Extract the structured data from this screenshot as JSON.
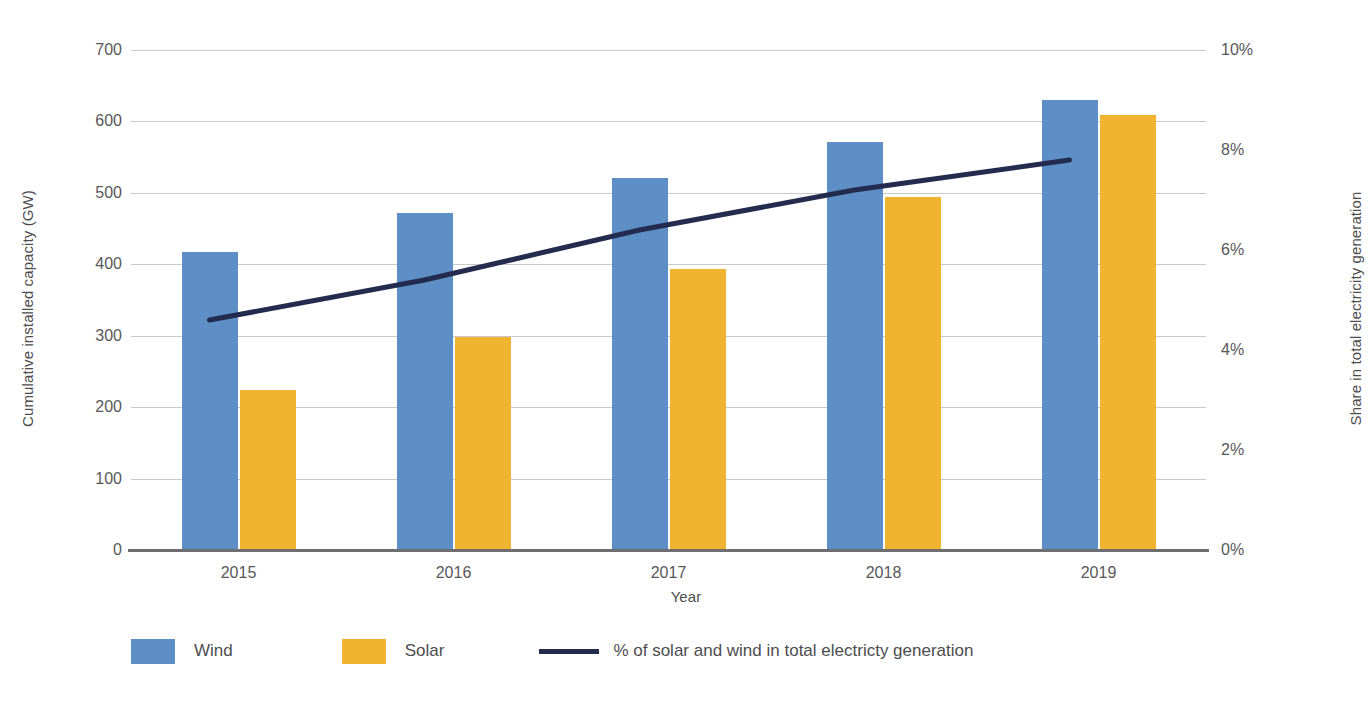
{
  "chart_data": {
    "type": "bar",
    "title": "",
    "subtitle": "",
    "xlabel": "Year",
    "ylabel": "Cumulative installed capacity (GW)",
    "y2label": "Share in total electricity generation",
    "categories": [
      "2015",
      "2016",
      "2017",
      "2018",
      "2019"
    ],
    "series": [
      {
        "name": "Wind",
        "type": "bar",
        "axis": "left",
        "color": "#5d8fc6",
        "unit": "GW",
        "values": [
          416,
          470,
          520,
          570,
          628
        ]
      },
      {
        "name": "Solar",
        "type": "bar",
        "axis": "left",
        "color": "#f0b431",
        "unit": "GW",
        "values": [
          222,
          297,
          392,
          493,
          607
        ]
      },
      {
        "name": "% of solar and wind in total electricty generation",
        "type": "line",
        "axis": "right",
        "color": "#232c4e",
        "unit": "%",
        "values": [
          4.6,
          5.4,
          6.4,
          7.2,
          7.8
        ]
      }
    ],
    "ylim": [
      0,
      700
    ],
    "y2lim": [
      0,
      10
    ],
    "ytick_step": 100,
    "y2tick_step": 2,
    "grid": true,
    "legend_position": "bottom-left"
  },
  "axes": {
    "left": {
      "title": "Cumulative installed capacity (GW)",
      "ticks": [
        "700",
        "600",
        "500",
        "400",
        "300",
        "200",
        "100",
        "0"
      ],
      "tick_values": [
        700,
        600,
        500,
        400,
        300,
        200,
        100,
        0
      ]
    },
    "right": {
      "title": "Share in total electricity generation",
      "ticks": [
        "10%",
        "8%",
        "6%",
        "4%",
        "2%",
        "0%"
      ],
      "tick_values": [
        10,
        8,
        6,
        4,
        2,
        0
      ]
    },
    "x": {
      "title": "Year",
      "ticks": [
        "2015",
        "2016",
        "2017",
        "2018",
        "2019"
      ]
    }
  },
  "legend": {
    "items": [
      {
        "label": "Wind",
        "marker": "square",
        "color": "#5d8fc6"
      },
      {
        "label": "Solar",
        "marker": "square",
        "color": "#f0b431"
      },
      {
        "label": "% of solar and wind in total electricty generation",
        "marker": "line",
        "color": "#232c4e"
      }
    ]
  },
  "colors": {
    "wind": "#5d8fc6",
    "solar": "#f0b431",
    "line": "#232c4e",
    "grid": "#c9c9c9",
    "axis": "#6e6e70",
    "text": "#58585a",
    "background": "#ffffff"
  }
}
